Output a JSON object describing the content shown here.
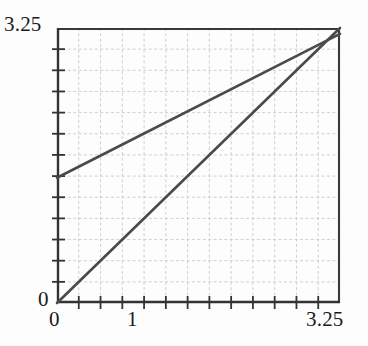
{
  "chart_data": {
    "type": "line",
    "title": "",
    "subtitle": "",
    "xlabel": "",
    "ylabel": "",
    "xlim": [
      0,
      3.25
    ],
    "ylim": [
      0,
      3.25
    ],
    "grid": true,
    "grid_step": 0.25,
    "grid_cells_x": 13,
    "grid_cells_y": 13,
    "legend": "none",
    "xticks": [
      0,
      0.25,
      0.5,
      0.75,
      1,
      1.25,
      1.5,
      1.75,
      2,
      2.25,
      2.5,
      2.75,
      3,
      3.25
    ],
    "yticks": [
      0,
      0.25,
      0.5,
      0.75,
      1,
      1.25,
      1.5,
      1.75,
      2,
      2.25,
      2.5,
      2.75,
      3,
      3.25
    ],
    "xtick_labels_shown": [
      "0",
      "1",
      "3.25"
    ],
    "ytick_labels_shown": [
      "3.25",
      "0"
    ],
    "annotations": [],
    "series": [
      {
        "name": "identity-line",
        "x": [
          0,
          3.25
        ],
        "values": [
          0,
          3.25
        ],
        "slope": 1,
        "intercept": 0,
        "color": "#4a4a4a",
        "style": "solid"
      },
      {
        "name": "transform-line",
        "x": [
          0,
          3.25
        ],
        "values": [
          1.48,
          3.18
        ],
        "slope": 0.523,
        "intercept": 1.48,
        "color": "#4a4a4a",
        "style": "solid"
      }
    ],
    "intersection": {
      "x": 3.02,
      "y": 3.02
    }
  },
  "axes": {
    "y_top_label": "3.25",
    "y_zero_label": "0",
    "x_zero_label": "0",
    "x_mid_label": "1",
    "x_max_label": "3.25"
  },
  "colors": {
    "background": "#fdfdfd",
    "axis": "#333333",
    "grid": "#c9c9cf",
    "line": "#4a4a4a",
    "text": "#1a1a1a"
  }
}
